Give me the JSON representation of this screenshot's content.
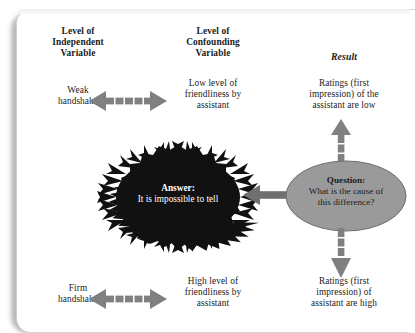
{
  "figure": {
    "columns": {
      "independent": "Level of\nIndependent\nVariable",
      "confounding": "Level of\nConfounding\nVariable",
      "result": "Result"
    },
    "rows": [
      {
        "independent": "Weak\nhandshake",
        "confounding": "Low level of\nfriendliness by\nassistant",
        "result": "Ratings (first\nimpression) of the\nassistant are low"
      },
      {
        "independent": "Firm\nhandshake",
        "confounding": "High level of\nfriendliness by\nassistant",
        "result": "Ratings (first\nimpression) of\nassistant are high"
      }
    ],
    "question": {
      "lead": "Question:",
      "text": "What is the cause of\nthis difference?"
    },
    "answer": {
      "lead": "Answer:",
      "text": "It is impossible to tell"
    },
    "arrows": {
      "top_bidirectional": "double-headed-arrow",
      "bottom_bidirectional": "double-headed-arrow",
      "up": "up-arrow",
      "down": "down-arrow",
      "left": "left-arrow"
    },
    "colors": {
      "arrow_gray": "#808080",
      "ellipse_fill": "#9a9a9a",
      "starburst_fill": "#111111",
      "text": "#1b1b1b",
      "page": "#ffffff"
    }
  }
}
